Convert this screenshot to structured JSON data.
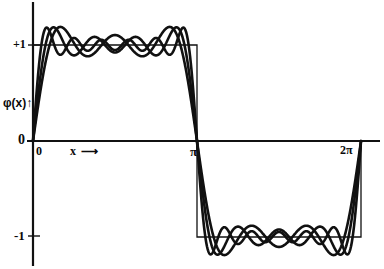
{
  "figure": {
    "kind": "fourier-square-wave-convergence",
    "background": "#ffffff",
    "ink": "#111111"
  },
  "axes": {
    "y_label": "φ(x)↑",
    "x_label": "x ⟶",
    "origin_label": "0",
    "y_zero_label": "0",
    "y_ticks": [
      {
        "value": 1,
        "label": "+1"
      },
      {
        "value": 0,
        "label": "0"
      },
      {
        "value": -1,
        "label": "-1"
      }
    ],
    "x_ticks": [
      {
        "value": 0,
        "label": "0"
      },
      {
        "value": 3.14159,
        "label": "π"
      },
      {
        "value": 6.28318,
        "label": "2π"
      }
    ],
    "xlim": [
      -0.05,
      6.6
    ],
    "ylim": [
      -1.45,
      1.45
    ],
    "grid": false,
    "legend": "none"
  },
  "chart_data": {
    "type": "line",
    "title": "",
    "xlabel": "x ⟶",
    "ylabel": "φ(x)",
    "xlim": [
      0,
      6.6
    ],
    "ylim": [
      -1.45,
      1.45
    ],
    "grid": false,
    "legend_position": "none",
    "x_tick_values": [
      0,
      3.14159,
      6.28318
    ],
    "x_tick_labels": [
      "0",
      "π",
      "2π"
    ],
    "y_tick_values": [
      1,
      0,
      -1
    ],
    "y_tick_labels": [
      "+1",
      "0",
      "-1"
    ],
    "series": [
      {
        "name": "square wave φ(x)",
        "kind": "step",
        "style": "thin",
        "description": "Ideal square wave: +1 on (0,π), -1 on (π,2π)",
        "points": [
          {
            "x": 0,
            "y": 0
          },
          {
            "x": 0,
            "y": 1
          },
          {
            "x": 3.14159,
            "y": 1
          },
          {
            "x": 3.14159,
            "y": -1
          },
          {
            "x": 6.28318,
            "y": -1
          },
          {
            "x": 6.28318,
            "y": 0
          }
        ]
      },
      {
        "name": "partial sum N=3",
        "kind": "fourier-odd-sine",
        "style": "thick",
        "harmonics": [
          1,
          3,
          5
        ],
        "amplitude_scale": 1.27324,
        "formula": "(4/π)·Σ sin((2k-1)x)/(2k-1), k=1..3"
      },
      {
        "name": "partial sum N=4",
        "kind": "fourier-odd-sine",
        "style": "thick",
        "harmonics": [
          1,
          3,
          5,
          7
        ],
        "amplitude_scale": 1.27324,
        "formula": "(4/π)·Σ sin((2k-1)x)/(2k-1), k=1..4"
      },
      {
        "name": "partial sum N=6",
        "kind": "fourier-odd-sine",
        "style": "thick",
        "harmonics": [
          1,
          3,
          5,
          7,
          9,
          11
        ],
        "amplitude_scale": 1.27324,
        "formula": "(4/π)·Σ sin((2k-1)x)/(2k-1), k=1..6"
      }
    ],
    "annotations": [
      {
        "text": "+1",
        "at": [
          0,
          1
        ]
      },
      {
        "text": "-1",
        "at": [
          0,
          -1
        ]
      },
      {
        "text": "0",
        "at": [
          0,
          0
        ]
      },
      {
        "text": "π",
        "at": [
          3.14159,
          0
        ]
      },
      {
        "text": "2π",
        "at": [
          6.28318,
          0
        ]
      },
      {
        "text": "x ⟶",
        "at": [
          1.0,
          -0.12
        ]
      },
      {
        "text": "φ(x)↑",
        "at": [
          -0.5,
          0.45
        ]
      }
    ]
  }
}
